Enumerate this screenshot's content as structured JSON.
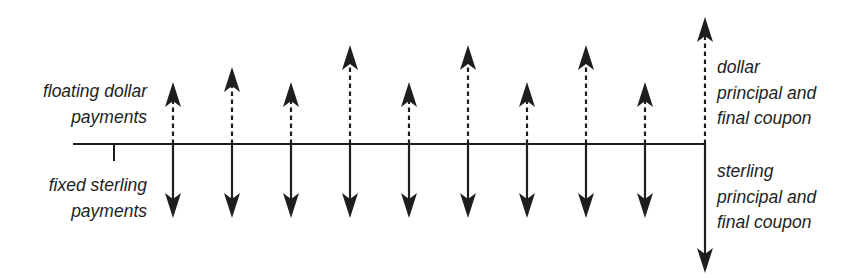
{
  "diagram": {
    "type": "cash-flow timeline (currency swap)",
    "colors": {
      "line": "#1e1e1e",
      "text": "#1e1e1e",
      "background": "#ffffff"
    },
    "timeline": {
      "x_start": 73,
      "x_end": 705,
      "y": 144,
      "start_tick": {
        "x": 114,
        "y_end": 161
      }
    },
    "labels": {
      "floating_dollar": [
        "floating dollar",
        "payments"
      ],
      "fixed_sterling": [
        "fixed sterling",
        "payments"
      ],
      "dollar_principal": [
        "dollar",
        "principal and",
        "final coupon"
      ],
      "sterling_principal": [
        "sterling",
        "principal and",
        "final coupon"
      ]
    },
    "periodic_flows": [
      {
        "x": 173,
        "dollar_up_tip_y": 82,
        "sterling_down_tip_y": 218
      },
      {
        "x": 232,
        "dollar_up_tip_y": 67,
        "sterling_down_tip_y": 218
      },
      {
        "x": 291,
        "dollar_up_tip_y": 82,
        "sterling_down_tip_y": 218
      },
      {
        "x": 350,
        "dollar_up_tip_y": 45,
        "sterling_down_tip_y": 218
      },
      {
        "x": 409,
        "dollar_up_tip_y": 82,
        "sterling_down_tip_y": 218
      },
      {
        "x": 468,
        "dollar_up_tip_y": 45,
        "sterling_down_tip_y": 218
      },
      {
        "x": 527,
        "dollar_up_tip_y": 82,
        "sterling_down_tip_y": 218
      },
      {
        "x": 586,
        "dollar_up_tip_y": 45,
        "sterling_down_tip_y": 218
      },
      {
        "x": 645,
        "dollar_up_tip_y": 82,
        "sterling_down_tip_y": 218
      }
    ],
    "final_flow": {
      "x": 705,
      "dollar_up_tip_y": 17,
      "sterling_down_tip_y": 273
    },
    "legend": {
      "dashed_up_arrow": "floating dollar payments",
      "solid_down_arrow": "fixed sterling payments"
    }
  }
}
